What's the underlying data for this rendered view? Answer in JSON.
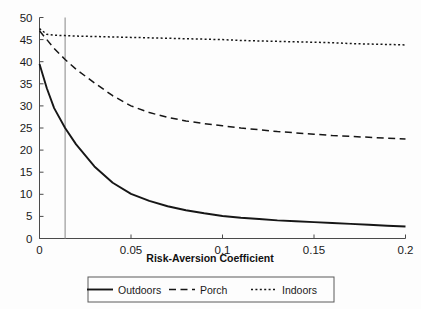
{
  "chart_data": {
    "type": "line",
    "title": "",
    "xlabel": "Risk-Aversion Coefficient",
    "ylabel": "",
    "xlim": [
      0,
      0.2
    ],
    "ylim": [
      0,
      50
    ],
    "grid": false,
    "legend_position": "bottom",
    "x_ticks": [
      "0",
      "0.05",
      "0.1",
      "0.15",
      "0.2"
    ],
    "x_tick_values": [
      0,
      0.05,
      0.1,
      0.15,
      0.2
    ],
    "y_ticks": [
      "0",
      "5",
      "10",
      "15",
      "20",
      "25",
      "30",
      "35",
      "40",
      "45",
      "50"
    ],
    "y_tick_values": [
      0,
      5,
      10,
      15,
      20,
      25,
      30,
      35,
      40,
      45,
      50
    ],
    "x": [
      0,
      0.004,
      0.008,
      0.014,
      0.02,
      0.03,
      0.04,
      0.05,
      0.06,
      0.07,
      0.08,
      0.09,
      0.1,
      0.11,
      0.12,
      0.13,
      0.14,
      0.15,
      0.16,
      0.17,
      0.18,
      0.19,
      0.2
    ],
    "series": [
      {
        "name": "Outdoors",
        "style": "solid",
        "color": "#161616",
        "values": [
          39.5,
          34.0,
          29.5,
          25.0,
          21.3,
          16.3,
          12.6,
          10.1,
          8.5,
          7.3,
          6.4,
          5.7,
          5.1,
          4.7,
          4.4,
          4.1,
          3.9,
          3.7,
          3.5,
          3.3,
          3.1,
          2.9,
          2.7
        ]
      },
      {
        "name": "Porch",
        "style": "dashed",
        "color": "#161616",
        "values": [
          47.0,
          45.0,
          43.0,
          40.5,
          38.3,
          35.2,
          32.3,
          30.0,
          28.5,
          27.4,
          26.6,
          26.0,
          25.5,
          25.0,
          24.6,
          24.2,
          23.9,
          23.6,
          23.3,
          23.1,
          22.9,
          22.7,
          22.5
        ]
      },
      {
        "name": "Indoors",
        "style": "dotted",
        "color": "#161616",
        "values": [
          47.5,
          46.2,
          46.0,
          45.9,
          45.8,
          45.7,
          45.6,
          45.5,
          45.4,
          45.3,
          45.2,
          45.1,
          45.0,
          44.8,
          44.7,
          44.6,
          44.5,
          44.4,
          44.3,
          44.1,
          44.0,
          43.9,
          43.8
        ]
      }
    ],
    "annotations": [
      {
        "type": "vertical-line",
        "name": "reference-line",
        "x": 0.014,
        "color": "#9a9a9a"
      }
    ]
  },
  "legend": {
    "items": [
      {
        "label": "Outdoors",
        "style": "solid"
      },
      {
        "label": "Porch",
        "style": "dashed"
      },
      {
        "label": "Indoors",
        "style": "dotted"
      }
    ]
  },
  "colors": {
    "line": "#161616",
    "axis": "#4a4a4a",
    "reference": "#9a9a9a",
    "background": "#fdfdfd"
  }
}
